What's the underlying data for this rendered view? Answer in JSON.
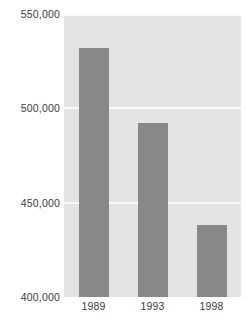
{
  "chart_data": {
    "type": "bar",
    "title": "",
    "subtitle": "",
    "xlabel": "",
    "ylabel": "",
    "categories": [
      "1989",
      "1993",
      "1998"
    ],
    "values": [
      532000,
      492000,
      438000
    ],
    "series": [
      {
        "name": "",
        "values": [
          532000,
          492000,
          438000
        ]
      }
    ],
    "ylim": [
      400000,
      550000
    ],
    "yticks": [
      400000,
      450000,
      500000,
      550000
    ],
    "ytick_labels": [
      "400,000",
      "450,000",
      "500,000",
      "550,000"
    ],
    "grid": true,
    "gridlines_at": [
      450000,
      500000,
      550000
    ],
    "legend": false,
    "legend_position": "none",
    "annotations": [],
    "colors": {
      "bar": "#888888",
      "plot_background": "#e4e4e4",
      "gridline": "#fafafa",
      "text": "#3b3b3b",
      "page_background": "#ffffff"
    }
  }
}
